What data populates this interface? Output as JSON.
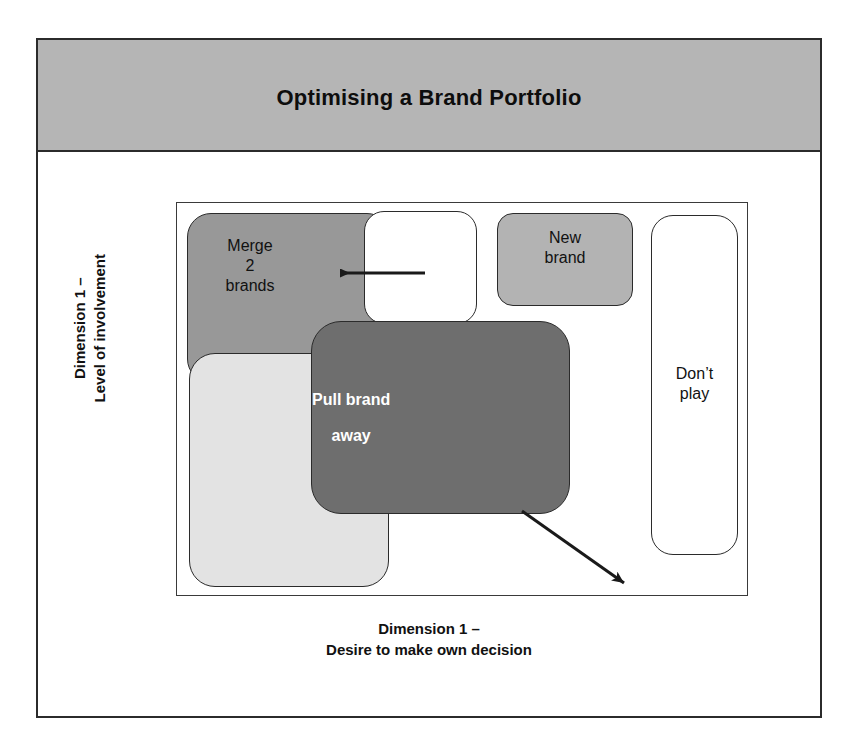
{
  "slide": {
    "title": "Optimising a Brand Portfolio"
  },
  "axes": {
    "y_label_line1": "Dimension 1 –",
    "y_label_line2": "Level of involvement",
    "x_label_line1": "Dimension 1 –",
    "x_label_line2": "Desire to make own decision"
  },
  "matrix": {
    "boxes": [
      {
        "id": "merge",
        "label_line1": "Merge",
        "label_line2": "2",
        "label_line3": "brands",
        "fill": "#989898",
        "text_color": "#111111"
      },
      {
        "id": "white-inner",
        "label": "",
        "fill": "#ffffff",
        "text_color": "#111111"
      },
      {
        "id": "new-brand",
        "label_line1": "New",
        "label_line2": "brand",
        "fill": "#b3b3b3",
        "text_color": "#111111"
      },
      {
        "id": "dont-play",
        "label_line1": "Don’t",
        "label_line2": "play",
        "fill": "#ffffff",
        "text_color": "#111111"
      },
      {
        "id": "light-unlabeled",
        "label": "",
        "fill": "#e3e3e3",
        "text_color": "#111111"
      },
      {
        "id": "pull-brand-away",
        "label_line1": "Pull brand",
        "label_line2": "away",
        "fill": "#6e6e6e",
        "text_color": "#ffffff"
      }
    ]
  },
  "arrows": [
    {
      "id": "merge-arrow",
      "direction": "left",
      "color": "#1a1a1a"
    },
    {
      "id": "pull-away-arrow",
      "direction": "down-right",
      "color": "#1a1a1a"
    }
  ],
  "theme": {
    "banner_fill": "#b5b5b5",
    "frame_stroke": "#2b2b2b",
    "page_background": "#ffffff"
  }
}
